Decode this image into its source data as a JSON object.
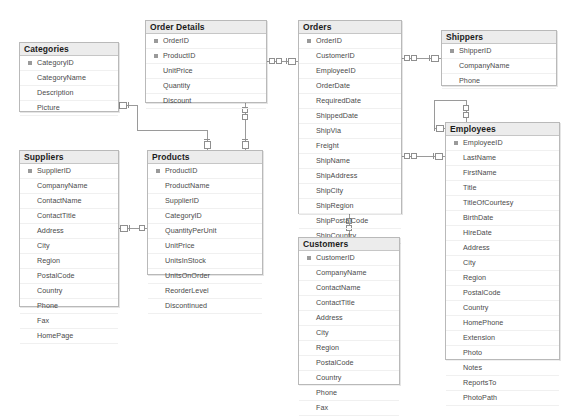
{
  "diagram": {
    "kind": "database-er-diagram",
    "name": "Northwind database schema",
    "background": "#ffffff",
    "line_color": "#9a9a9a",
    "header_color": "#ececec",
    "border_color": "#b9b9b9",
    "text_color": "#4a4a4a",
    "title_color": "#1b1b1b"
  },
  "entities": [
    {
      "id": "categories",
      "title": "Categories",
      "x": 19,
      "y": 42,
      "w": 100,
      "h": 70,
      "fields": [
        {
          "name": "CategoryID",
          "key": true
        },
        {
          "name": "CategoryName",
          "key": false
        },
        {
          "name": "Description",
          "key": false
        },
        {
          "name": "Picture",
          "key": false
        }
      ]
    },
    {
      "id": "order_details",
      "title": "Order Details",
      "x": 145,
      "y": 20,
      "w": 122,
      "h": 83,
      "fields": [
        {
          "name": "OrderID",
          "key": true
        },
        {
          "name": "ProductID",
          "key": true
        },
        {
          "name": "UnitPrice",
          "key": false
        },
        {
          "name": "Quantity",
          "key": false
        },
        {
          "name": "Discount",
          "key": false
        }
      ]
    },
    {
      "id": "orders",
      "title": "Orders",
      "x": 298,
      "y": 20,
      "w": 104,
      "h": 194,
      "fields": [
        {
          "name": "OrderID",
          "key": true
        },
        {
          "name": "CustomerID",
          "key": false
        },
        {
          "name": "EmployeeID",
          "key": false
        },
        {
          "name": "OrderDate",
          "key": false
        },
        {
          "name": "RequiredDate",
          "key": false
        },
        {
          "name": "ShippedDate",
          "key": false
        },
        {
          "name": "ShipVia",
          "key": false
        },
        {
          "name": "Freight",
          "key": false
        },
        {
          "name": "ShipName",
          "key": false
        },
        {
          "name": "ShipAddress",
          "key": false
        },
        {
          "name": "ShipCity",
          "key": false
        },
        {
          "name": "ShipRegion",
          "key": false
        },
        {
          "name": "ShipPostalCode",
          "key": false
        },
        {
          "name": "ShipCountry",
          "key": false
        }
      ]
    },
    {
      "id": "shippers",
      "title": "Shippers",
      "x": 441,
      "y": 30,
      "w": 116,
      "h": 56,
      "fields": [
        {
          "name": "ShipperID",
          "key": true
        },
        {
          "name": "CompanyName",
          "key": false
        },
        {
          "name": "Phone",
          "key": false
        }
      ]
    },
    {
      "id": "employees",
      "title": "Employees",
      "x": 445,
      "y": 122,
      "w": 115,
      "h": 238,
      "fields": [
        {
          "name": "EmployeeID",
          "key": true
        },
        {
          "name": "LastName",
          "key": false
        },
        {
          "name": "FirstName",
          "key": false
        },
        {
          "name": "Title",
          "key": false
        },
        {
          "name": "TitleOfCourtesy",
          "key": false
        },
        {
          "name": "BirthDate",
          "key": false
        },
        {
          "name": "HireDate",
          "key": false
        },
        {
          "name": "Address",
          "key": false
        },
        {
          "name": "City",
          "key": false
        },
        {
          "name": "Region",
          "key": false
        },
        {
          "name": "PostalCode",
          "key": false
        },
        {
          "name": "Country",
          "key": false
        },
        {
          "name": "HomePhone",
          "key": false
        },
        {
          "name": "Extension",
          "key": false
        },
        {
          "name": "Photo",
          "key": false
        },
        {
          "name": "Notes",
          "key": false
        },
        {
          "name": "ReportsTo",
          "key": false
        },
        {
          "name": "PhotoPath",
          "key": false
        }
      ]
    },
    {
      "id": "suppliers",
      "title": "Suppliers",
      "x": 19,
      "y": 150,
      "w": 100,
      "h": 157,
      "fields": [
        {
          "name": "SupplierID",
          "key": true
        },
        {
          "name": "CompanyName",
          "key": false
        },
        {
          "name": "ContactName",
          "key": false
        },
        {
          "name": "ContactTitle",
          "key": false
        },
        {
          "name": "Address",
          "key": false
        },
        {
          "name": "City",
          "key": false
        },
        {
          "name": "Region",
          "key": false
        },
        {
          "name": "PostalCode",
          "key": false
        },
        {
          "name": "Country",
          "key": false
        },
        {
          "name": "Phone",
          "key": false
        },
        {
          "name": "Fax",
          "key": false
        },
        {
          "name": "HomePage",
          "key": false
        }
      ]
    },
    {
      "id": "products",
      "title": "Products",
      "x": 147,
      "y": 150,
      "w": 116,
      "h": 125,
      "fields": [
        {
          "name": "ProductID",
          "key": true
        },
        {
          "name": "ProductName",
          "key": false
        },
        {
          "name": "SupplierID",
          "key": false
        },
        {
          "name": "CategoryID",
          "key": false
        },
        {
          "name": "QuantityPerUnit",
          "key": false
        },
        {
          "name": "UnitPrice",
          "key": false
        },
        {
          "name": "UnitsInStock",
          "key": false
        },
        {
          "name": "UnitsOnOrder",
          "key": false
        },
        {
          "name": "ReorderLevel",
          "key": false
        },
        {
          "name": "Discontinued",
          "key": false
        }
      ]
    },
    {
      "id": "customers",
      "title": "Customers",
      "x": 298,
      "y": 237,
      "w": 102,
      "h": 148,
      "fields": [
        {
          "name": "CustomerID",
          "key": true
        },
        {
          "name": "CompanyName",
          "key": false
        },
        {
          "name": "ContactName",
          "key": false
        },
        {
          "name": "ContactTitle",
          "key": false
        },
        {
          "name": "Address",
          "key": false
        },
        {
          "name": "City",
          "key": false
        },
        {
          "name": "Region",
          "key": false
        },
        {
          "name": "PostalCode",
          "key": false
        },
        {
          "name": "Country",
          "key": false
        },
        {
          "name": "Phone",
          "key": false
        },
        {
          "name": "Fax",
          "key": false
        }
      ]
    }
  ],
  "relationships": [
    {
      "id": "rel-categories-products",
      "from": "categories",
      "to": "products",
      "from_card": "one",
      "to_card": "many"
    },
    {
      "id": "rel-orderdetails-products",
      "from": "order_details",
      "to": "products",
      "from_card": "many",
      "to_card": "one"
    },
    {
      "id": "rel-orderdetails-orders",
      "from": "order_details",
      "to": "orders",
      "from_card": "many",
      "to_card": "one"
    },
    {
      "id": "rel-orders-shippers",
      "from": "orders",
      "to": "shippers",
      "from_card": "many",
      "to_card": "one"
    },
    {
      "id": "rel-orders-employees",
      "from": "orders",
      "to": "employees",
      "from_card": "many",
      "to_card": "one"
    },
    {
      "id": "rel-orders-customers",
      "from": "orders",
      "to": "customers",
      "from_card": "many",
      "to_card": "one"
    },
    {
      "id": "rel-suppliers-products",
      "from": "suppliers",
      "to": "products",
      "from_card": "one",
      "to_card": "many"
    },
    {
      "id": "rel-employees-employees",
      "from": "employees",
      "to": "employees",
      "from_card": "one",
      "to_card": "many"
    }
  ]
}
